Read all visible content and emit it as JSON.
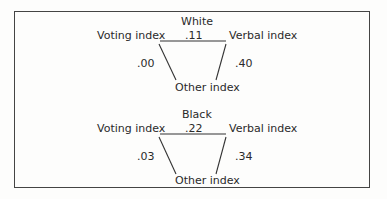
{
  "diagrams": [
    {
      "title": "White",
      "nodes": {
        "left": "Voting index",
        "right": "Verbal index",
        "bottom": "Other index"
      },
      "edges": {
        "voting_verbal": ".11",
        "voting_other": ".00",
        "verbal_other": ".40"
      }
    },
    {
      "title": "Black",
      "nodes": {
        "left": "Voting index",
        "right": "Verbal index",
        "bottom": "Other index"
      },
      "edges": {
        "voting_verbal": ".22",
        "voting_other": ".03",
        "verbal_other": ".34"
      }
    }
  ]
}
